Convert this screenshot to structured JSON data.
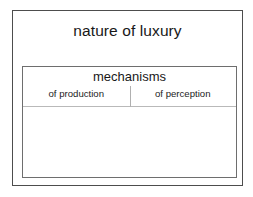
{
  "diagram": {
    "title": "nature of luxury",
    "inner": {
      "header": "mechanisms",
      "columns": [
        {
          "label": "of production",
          "content": ""
        },
        {
          "label": "of perception",
          "content": ""
        }
      ]
    }
  },
  "colors": {
    "outer_border": "#4d4d4d",
    "inner_border": "#6e6e6e",
    "divider": "#b0b0b0",
    "rule": "#b9b9b9",
    "background": "#ffffff",
    "text": "#181818"
  }
}
